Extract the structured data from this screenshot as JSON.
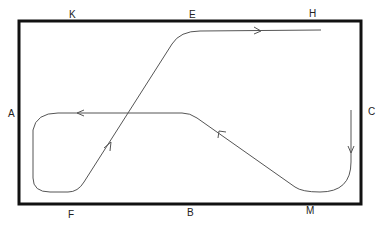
{
  "diagram": {
    "type": "track-path",
    "labels": {
      "K": "K",
      "E": "E",
      "H": "H",
      "A": "A",
      "C": "C",
      "F": "F",
      "B": "B",
      "M": "M"
    },
    "colors": {
      "border": "#111111",
      "path": "#555555",
      "label": "#222222"
    },
    "path_description": "Start at H (top right) moving left? No — path starts near C moving down, curves at M, travels up-left toward B, runs left along the middle line past A, loops around near F, rises diagonally up-right through center to E, then heads right toward H.",
    "arrows": [
      "top segment pointing right",
      "middle segment pointing left",
      "diagonal pointing up-right",
      "diagonal from M pointing up-left",
      "right vertical pointing down"
    ]
  }
}
